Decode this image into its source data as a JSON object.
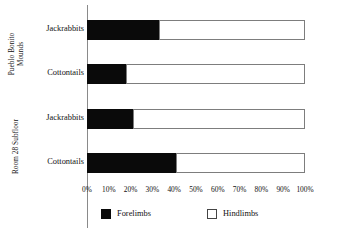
{
  "chart_data": {
    "type": "bar",
    "subtype": "stacked-horizontal-100-percent",
    "title": "",
    "xlabel": "",
    "ylabel": "",
    "xlim": [
      0,
      100
    ],
    "grid": false,
    "legend_position": "bottom",
    "categories": [
      "Jackrabbits",
      "Cottontails",
      "Jackrabbits",
      "Cottontails"
    ],
    "groups": [
      {
        "label_line1": "Pueblo Bonito",
        "label_line2": "Mounds",
        "categories": [
          "Jackrabbits",
          "Cottontails"
        ]
      },
      {
        "label_line1": "Room 28 Subfloor",
        "label_line2": "",
        "categories": [
          "Jackrabbits",
          "Cottontails"
        ]
      }
    ],
    "series": [
      {
        "name": "Forelimbs",
        "color": "#0a0a0a",
        "values": [
          33,
          18,
          21,
          41
        ]
      },
      {
        "name": "Hindlimbs",
        "color": "#ffffff",
        "values": [
          67,
          82,
          79,
          59
        ]
      }
    ],
    "bars": [
      {
        "group": "Pueblo Bonito Mounds",
        "category": "Jackrabbits",
        "forelimbs": 33,
        "hindlimbs": 67
      },
      {
        "group": "Pueblo Bonito Mounds",
        "category": "Cottontails",
        "forelimbs": 18,
        "hindlimbs": 82
      },
      {
        "group": "Room 28 Subfloor",
        "category": "Jackrabbits",
        "forelimbs": 21,
        "hindlimbs": 79
      },
      {
        "group": "Room 28 Subfloor",
        "category": "Cottontails",
        "forelimbs": 41,
        "hindlimbs": 59
      }
    ],
    "xticks": [
      "0%",
      "10%",
      "20%",
      "30%",
      "40%",
      "50%",
      "60%",
      "70%",
      "80%",
      "90%",
      "100%"
    ],
    "xtick_values": [
      0,
      10,
      20,
      30,
      40,
      50,
      60,
      70,
      80,
      90,
      100
    ],
    "legend": [
      {
        "label": "Forelimbs",
        "color": "#0a0a0a"
      },
      {
        "label": "Hindlimbs",
        "color": "#ffffff"
      }
    ]
  }
}
